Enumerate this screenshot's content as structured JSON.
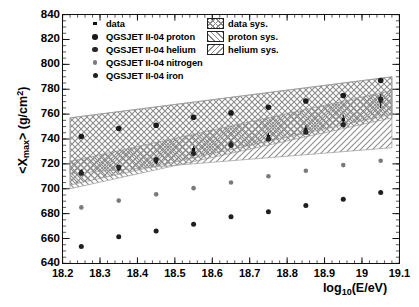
{
  "chart_data": {
    "type": "scatter",
    "title": "",
    "xlabel": "log10(E/eV)",
    "ylabel": "<Xmax> (g/cm2)",
    "xlim": [
      18.2,
      19.1
    ],
    "ylim": [
      640,
      840
    ],
    "xticks": [
      "18.2",
      "18.3",
      "18.4",
      "18.5",
      "18.6",
      "18.7",
      "18.8",
      "18.9",
      "19",
      "19.1"
    ],
    "xtick_values": [
      18.2,
      18.3,
      18.4,
      18.5,
      18.6,
      18.7,
      18.8,
      18.9,
      19.0,
      19.1
    ],
    "yticks": [
      "640",
      "660",
      "680",
      "700",
      "720",
      "740",
      "760",
      "780",
      "800",
      "820",
      "840"
    ],
    "ytick_values": [
      640,
      660,
      680,
      700,
      720,
      740,
      760,
      780,
      800,
      820,
      840
    ],
    "grid": false,
    "legend_position": "top-left",
    "x": [
      18.25,
      18.35,
      18.45,
      18.55,
      18.65,
      18.75,
      18.85,
      18.95,
      19.05
    ],
    "series": [
      {
        "name": "data",
        "marker": "small-dot",
        "color": "#111111",
        "size": 3.2,
        "values": [
          713.5,
          716.0,
          722.0,
          731.5,
          736.0,
          742.0,
          747.5,
          755.5,
          770.5
        ],
        "yerr": [
          2.2,
          2.2,
          2.4,
          2.6,
          2.8,
          3.0,
          3.4,
          4.0,
          5.5
        ]
      },
      {
        "name": "QGSJET II-04 proton",
        "marker": "circle",
        "color": "#1a1a1a",
        "size": 5.6,
        "values": [
          742.0,
          748.5,
          751.0,
          757.5,
          761.0,
          765.5,
          770.5,
          775.0,
          787.0
        ],
        "yerr": [
          0.9,
          0.9,
          0.9,
          1.0,
          1.0,
          1.1,
          1.1,
          1.2,
          1.5
        ]
      },
      {
        "name": "QGSJET II-04 helium",
        "marker": "circle",
        "color": "#262626",
        "size": 5.2,
        "values": [
          712.5,
          717.5,
          723.5,
          728.5,
          735.0,
          740.0,
          745.5,
          751.5,
          772.0
        ],
        "yerr": [
          0.9,
          0.9,
          0.9,
          1.0,
          1.0,
          1.1,
          1.1,
          1.2,
          1.5
        ]
      },
      {
        "name": "QGSJET II-04 nitrogen",
        "marker": "circle",
        "color": "#7a7a7a",
        "size": 4.6,
        "values": [
          685.0,
          690.5,
          695.5,
          700.5,
          705.0,
          710.0,
          714.5,
          719.0,
          722.5
        ],
        "yerr": [
          0.8,
          0.8,
          0.9,
          0.9,
          1.0,
          1.0,
          1.1,
          1.1,
          1.3
        ]
      },
      {
        "name": "QGSJET II-04 iron",
        "marker": "circle",
        "color": "#1f1f1f",
        "size": 5.0,
        "values": [
          653.5,
          661.5,
          666.0,
          671.5,
          677.5,
          681.5,
          686.5,
          691.5,
          697.0
        ],
        "yerr": [
          0.8,
          0.8,
          0.9,
          0.9,
          1.0,
          1.0,
          1.1,
          1.1,
          1.3
        ]
      }
    ],
    "bands": [
      {
        "name": "data sys.",
        "hatch": "cross",
        "x": [
          18.22,
          19.08
        ],
        "upper": [
          722.0,
          779.0
        ],
        "lower": [
          703.0,
          760.0
        ]
      },
      {
        "name": "proton sys.",
        "hatch": "backslash",
        "x": [
          18.22,
          19.08
        ],
        "upper": [
          757.0,
          790.0
        ],
        "lower": [
          700.0,
          757.0
        ]
      },
      {
        "name": "helium sys.",
        "hatch": "slash",
        "x": [
          18.22,
          19.08
        ],
        "upper": [
          757.0,
          790.0
        ],
        "lower": [
          712.0,
          733.0
        ]
      }
    ]
  },
  "axes": {
    "y_title_pre": "<X",
    "y_title_sub": "max",
    "y_title_mid": "> (g/cm",
    "y_title_sup": "2",
    "y_title_post": ")",
    "x_title_pre": "log",
    "x_title_sub": "10",
    "x_title_post": "(E/eV)"
  },
  "legend_series": [
    {
      "label": "data",
      "marker": "small-dot"
    },
    {
      "label": "QGSJET II-04 proton",
      "marker": "circle"
    },
    {
      "label": "QGSJET II-04 helium",
      "marker": "circle"
    },
    {
      "label": "QGSJET II-04 nitrogen",
      "marker": "circle"
    },
    {
      "label": "QGSJET II-04 iron",
      "marker": "circle"
    }
  ],
  "legend_systematics": [
    {
      "label": "data sys.",
      "hatch": "cross"
    },
    {
      "label": "proton sys.",
      "hatch": "backslash"
    },
    {
      "label": "helium sys.",
      "hatch": "slash"
    }
  ]
}
